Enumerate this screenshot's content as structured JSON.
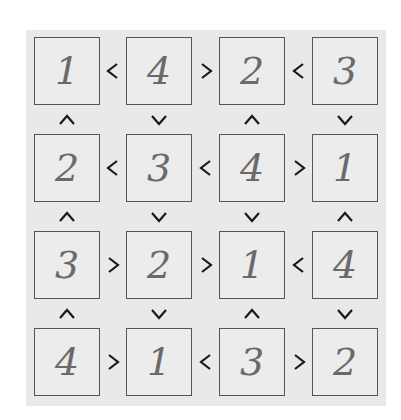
{
  "puzzle": {
    "type": "futoshiki",
    "size": 4,
    "grid": [
      [
        "1",
        "4",
        "2",
        "3"
      ],
      [
        "2",
        "3",
        "4",
        "1"
      ],
      [
        "3",
        "2",
        "1",
        "4"
      ],
      [
        "4",
        "1",
        "3",
        "2"
      ]
    ],
    "horizontal_signs": [
      [
        "<",
        ">",
        "<"
      ],
      [
        "<",
        "<",
        ">"
      ],
      [
        ">",
        ">",
        "<"
      ],
      [
        ">",
        "<",
        ">"
      ]
    ],
    "vertical_signs": [
      [
        "^",
        "v",
        "^",
        "v"
      ],
      [
        "^",
        "v",
        "v",
        "^"
      ],
      [
        "^",
        "v",
        "^",
        "v"
      ]
    ]
  },
  "colors": {
    "panel_bg": "#e9e9e9",
    "cell_border": "#555555",
    "ink": "#6a6a6a",
    "sign": "#1a1a1a"
  }
}
